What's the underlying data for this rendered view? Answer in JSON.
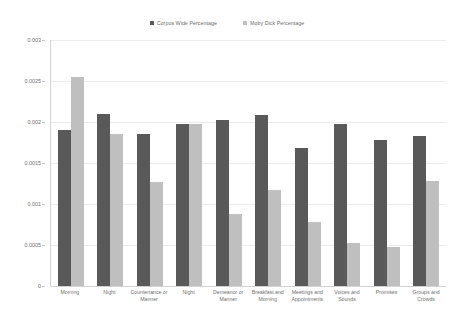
{
  "chart_data": {
    "type": "bar",
    "title": "",
    "xlabel": "",
    "ylabel": "",
    "ylim": [
      0,
      0.003
    ],
    "grid": true,
    "legend_position": "top-center",
    "yticks": [
      "0",
      "0.0005",
      "0.001",
      "0.0015",
      "0.002",
      "0.0025",
      "0.003"
    ],
    "ytick_values": [
      0,
      0.0005,
      0.001,
      0.0015,
      0.002,
      0.0025,
      0.003
    ],
    "categories": [
      "Morning",
      "Night",
      "Countenance or Manner",
      "Night",
      "Demeanor or Manner",
      "Breakfast and Morning",
      "Meetings and Appointments",
      "Voices and Sounds",
      "Promises",
      "Groups and Crowds"
    ],
    "series": [
      {
        "name": "Corpus Wide Percentage",
        "color": "#595959",
        "values": [
          0.0019,
          0.0021,
          0.00185,
          0.00197,
          0.00203,
          0.00208,
          0.00168,
          0.00198,
          0.00178,
          0.00183
        ]
      },
      {
        "name": "Moby Dick Percentage",
        "color": "#bfbfbf",
        "values": [
          0.00255,
          0.00185,
          0.00127,
          0.00197,
          0.00088,
          0.00117,
          0.00078,
          0.00053,
          0.00047,
          0.00128
        ]
      }
    ]
  },
  "legend": {
    "items": [
      {
        "label": "Corpus Wide Percentage",
        "color": "#595959"
      },
      {
        "label": "Moby Dick Percentage",
        "color": "#bfbfbf"
      }
    ]
  }
}
